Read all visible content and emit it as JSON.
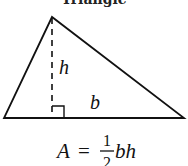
{
  "title": "Triangle",
  "labels": {
    "height": "h",
    "base": "b"
  },
  "formula": {
    "lhs": "A",
    "equals": "=",
    "numerator": "1",
    "denominator": "2",
    "rhs_vars": "bh"
  },
  "colors": {
    "stroke": "#111111",
    "background": "#ffffff"
  }
}
